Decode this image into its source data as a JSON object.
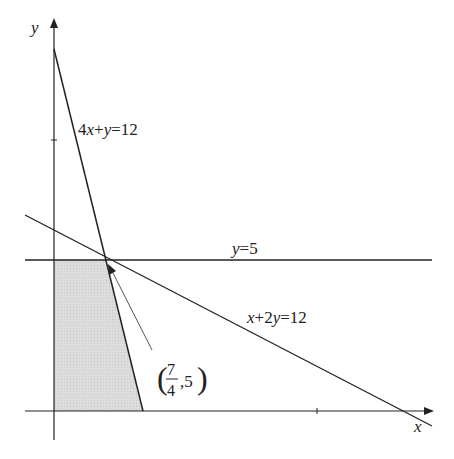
{
  "diagram": {
    "axes": {
      "x_label": "x",
      "y_label": "y"
    },
    "lines": [
      {
        "id": "line-4x-y",
        "label": "4x+y=12",
        "label_parts": [
          "4",
          "x",
          "+",
          "y",
          "=12"
        ]
      },
      {
        "id": "line-y5",
        "label": "y=5",
        "label_parts": [
          "y",
          "=5"
        ]
      },
      {
        "id": "line-x-2y",
        "label": "x+2y=12",
        "label_parts": [
          "x",
          "+2",
          "y",
          "=12"
        ]
      }
    ],
    "point": {
      "label": "(7/4, 5)",
      "frac_num": "7",
      "frac_den": "4",
      "y_value": ",5",
      "open_paren": "(",
      "close_paren": ")"
    },
    "feasible_region": {
      "description": "Shaded region bounded by x=0, y=0, y=5, 4x+y=12",
      "fill": "#d9d9d9"
    },
    "colors": {
      "line": "#222222",
      "shade": "#d9d9d9",
      "pointer": "#555555"
    }
  }
}
